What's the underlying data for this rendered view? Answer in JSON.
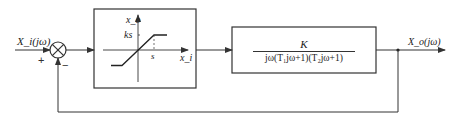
{
  "diagram": {
    "type": "closed-loop block diagram",
    "input_label": "X_i(jω)",
    "output_label": "X_o(jω)",
    "summing_junction": {
      "plus_sign": "+",
      "minus_sign": "−"
    },
    "nonlinear_block": {
      "description": "saturation nonlinearity",
      "y_axis_label": "x_o",
      "x_axis_label": "x_i",
      "saturation_output_label": "ks",
      "saturation_input_label": "s"
    },
    "linear_block": {
      "numerator": "K",
      "denominator": "jω(T₁jω+1)(T₂jω+1)"
    },
    "feedback": "unity negative feedback",
    "colors": {
      "line": "#333333",
      "background": "#ffffff"
    }
  }
}
